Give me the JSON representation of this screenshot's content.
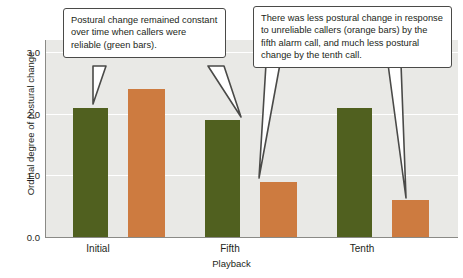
{
  "chart_data": {
    "type": "bar",
    "title": "",
    "xlabel": "Playback",
    "ylabel": "Ordinal degree of postural change",
    "categories": [
      "Initial",
      "Fifth",
      "Tenth"
    ],
    "series": [
      {
        "name": "Reliable callers (green bars)",
        "color": "#50601f",
        "values": [
          2.1,
          1.9,
          2.1
        ]
      },
      {
        "name": "Unreliable callers (orange bars)",
        "color": "#cd7b40",
        "values": [
          2.4,
          0.9,
          0.6
        ]
      }
    ],
    "ylim": [
      0.0,
      3.2
    ],
    "yticks": [
      "0.0",
      "1.0",
      "2.0",
      "3.0"
    ],
    "ytick_values": [
      0.0,
      1.0,
      2.0,
      3.0
    ],
    "grid": "horizontal",
    "legend": "none",
    "annotations": [
      "Postural change remained constant over time when callers were reliable (green bars).",
      "There was less postural change in response to unreliable callers (orange bars) by the fifth alarm call, and much less postural change by the tenth call."
    ]
  },
  "axes": {
    "ylabel": "Ordinal degree of postural change",
    "xlabel": "Playback",
    "yticks": [
      {
        "label": "3.0"
      },
      {
        "label": "2.0"
      },
      {
        "label": "1.0"
      },
      {
        "label": "0.0"
      }
    ],
    "xticks": [
      {
        "label": "Initial"
      },
      {
        "label": "Fifth"
      },
      {
        "label": "Tenth"
      }
    ]
  },
  "callouts": {
    "left": {
      "text": "Postural change remained constant over time when callers were reliable (green bars)."
    },
    "right": {
      "text": "There was less postural change in response to unreliable callers (orange bars) by the fifth alarm call, and much less postural change by the tenth call."
    }
  },
  "colors": {
    "green": "#50601f",
    "orange": "#cd7b40",
    "plot_background": "#e9e9e6",
    "gridline": "#ffffff",
    "axis": "#8a8a86",
    "text": "#231f20",
    "callout_border": "#4a4a48"
  }
}
